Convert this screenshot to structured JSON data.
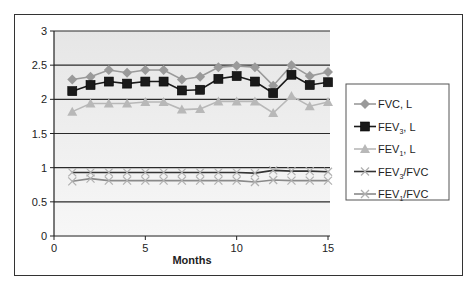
{
  "chart_data": {
    "type": "line",
    "title": "",
    "xlabel": "Months",
    "ylabel": "",
    "xlim": [
      0,
      15
    ],
    "ylim": [
      0,
      3
    ],
    "x_ticks": [
      "0",
      "5",
      "10",
      "15"
    ],
    "y_ticks": [
      "0",
      "0.5",
      "1",
      "1.5",
      "2",
      "2.5",
      "3"
    ],
    "grid": "horizontal",
    "legend_position": "right",
    "x": [
      1,
      2,
      3,
      4,
      5,
      6,
      7,
      8,
      9,
      10,
      11,
      12,
      13,
      14,
      15
    ],
    "series": [
      {
        "name": "FVC, L",
        "marker": "diamond",
        "color": "#9a9a9a",
        "values": [
          2.29,
          2.33,
          2.43,
          2.39,
          2.43,
          2.43,
          2.29,
          2.33,
          2.47,
          2.49,
          2.47,
          2.2,
          2.5,
          2.34,
          2.4
        ]
      },
      {
        "name": "FEV3, L",
        "marker": "square",
        "color": "#1a1a1a",
        "values": [
          2.12,
          2.21,
          2.26,
          2.23,
          2.26,
          2.26,
          2.13,
          2.14,
          2.3,
          2.34,
          2.26,
          2.09,
          2.36,
          2.21,
          2.25
        ]
      },
      {
        "name": "FEV1, L",
        "marker": "triangle",
        "color": "#b8b8b8",
        "values": [
          1.82,
          1.94,
          1.94,
          1.94,
          1.96,
          1.96,
          1.85,
          1.86,
          1.97,
          1.97,
          1.97,
          1.8,
          2.05,
          1.9,
          1.96
        ]
      },
      {
        "name": "FEV3/FVC",
        "marker": "x",
        "color": "#333333",
        "values": [
          0.93,
          0.93,
          0.93,
          0.93,
          0.93,
          0.93,
          0.93,
          0.93,
          0.93,
          0.93,
          0.92,
          0.96,
          0.95,
          0.95,
          0.94
        ]
      },
      {
        "name": "FEV1/FVC",
        "marker": "x",
        "color": "#8a8a8a",
        "values": [
          0.8,
          0.84,
          0.81,
          0.81,
          0.81,
          0.81,
          0.81,
          0.81,
          0.81,
          0.81,
          0.79,
          0.82,
          0.81,
          0.81,
          0.81
        ]
      }
    ]
  },
  "legend": {
    "items": [
      {
        "main": "FVC, L",
        "pre": "FVC, L",
        "sub": "",
        "post": ""
      },
      {
        "pre": "FEV",
        "sub": "3",
        "post": ", L"
      },
      {
        "pre": "FEV",
        "sub": "1",
        "post": ", L"
      },
      {
        "pre": "FEV",
        "sub": "3",
        "post": "/FVC"
      },
      {
        "pre": "FEV",
        "sub": "1",
        "post": "/FVC"
      }
    ]
  }
}
